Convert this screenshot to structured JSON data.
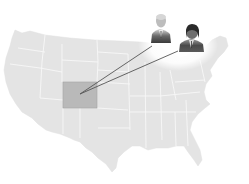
{
  "map": {
    "region": "United States",
    "highlighted_state": "Colorado",
    "colors": {
      "land": "#e4e4e4",
      "borders": "#f6f6f6",
      "highlight": "#b9b9b9",
      "highlight_border": "#9a9a9a",
      "connector": "#555555",
      "background": "#ffffff"
    }
  },
  "connectors": [
    {
      "from": "Colorado",
      "to": "portrait-1"
    },
    {
      "from": "Colorado",
      "to": "portrait-2"
    }
  ],
  "portraits": [
    {
      "id": "portrait-1",
      "description": "older man in suit"
    },
    {
      "id": "portrait-2",
      "description": "man with dark hair in suit"
    }
  ]
}
